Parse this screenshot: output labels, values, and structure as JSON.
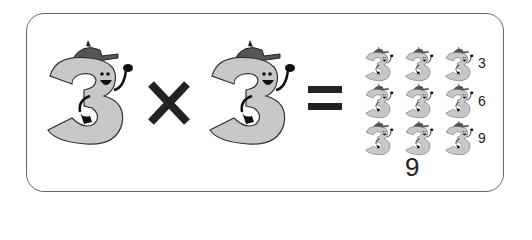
{
  "equation": {
    "left_operand": "3",
    "operator": "×",
    "right_operand": "3",
    "equals": "="
  },
  "grid": {
    "rows": 3,
    "cols": 3,
    "row_labels": [
      "3",
      "6",
      "9"
    ],
    "total": "9"
  },
  "colors": {
    "character_fill": "#c8c8c8",
    "outline": "#222222",
    "frame": "#666666"
  }
}
